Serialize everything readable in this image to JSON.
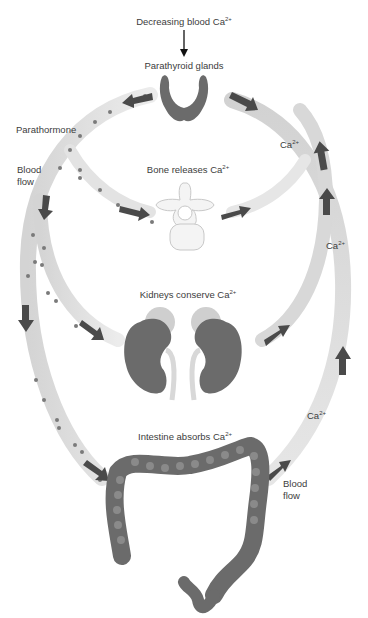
{
  "diagram": {
    "title_trigger": {
      "text": "Decreasing blood Ca",
      "sup": "2+"
    },
    "nodes": {
      "parathyroid": {
        "label": "Parathyroid glands"
      },
      "bone": {
        "label": "Bone releases Ca",
        "sup": "2+"
      },
      "kidneys": {
        "label": "Kidneys conserve Ca",
        "sup": "2+"
      },
      "intestine": {
        "label": "Intestine absorbs Ca",
        "sup": "2+"
      }
    },
    "side_labels": {
      "parathormone": "Parathormone",
      "blood_flow_left_1": "Blood",
      "blood_flow_left_2": "flow",
      "blood_flow_right_1": "Blood",
      "blood_flow_right_2": "flow"
    },
    "calcium_labels": [
      {
        "text": "Ca",
        "sup": "2+"
      },
      {
        "text": "Ca",
        "sup": "2+"
      },
      {
        "text": "Ca",
        "sup": "2+"
      }
    ],
    "colors": {
      "pathway": "#dcdcdc",
      "arrow": "#4a4a4a",
      "organ": "#6b6b6b",
      "hormone_dot": "#7a7a7a"
    }
  }
}
